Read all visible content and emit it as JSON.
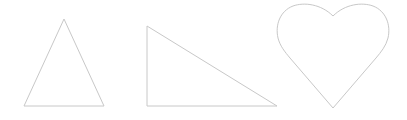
{
  "canvas": {
    "width": 407,
    "height": 120,
    "background": "#ffffff"
  },
  "style": {
    "stroke_color": "#c8c8c8",
    "fill_color": "none"
  },
  "shapes": [
    {
      "name": "triangle",
      "kind": "isosceles-triangle",
      "points": "64,19 104,106 24,106"
    },
    {
      "name": "right-triangle",
      "kind": "right-triangle",
      "points": "147,26 277,106 147,106"
    },
    {
      "name": "heart",
      "kind": "heart",
      "path": "M333,16 C345,4 362,2 373,6 C386,11 391,25 388,38 C386,46 381,52 376,58 L333,108 L290,58 C285,52 280,46 278,38 C275,25 280,11 293,6 C304,2 321,4 333,16 Z"
    }
  ]
}
